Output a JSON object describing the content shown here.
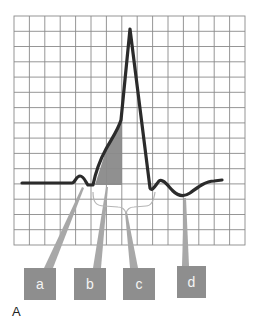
{
  "figure": {
    "panel_label": "A",
    "grid": {
      "x0": 14,
      "y0": 16,
      "x1": 245,
      "y1": 245,
      "cols": 15,
      "rows": 15,
      "color": "#8a8a8a"
    },
    "waveform": {
      "color": "#2b2b2b",
      "baseline_y": 183,
      "shaded_region_color": "#8a8a8a"
    },
    "labels": [
      {
        "id": "a",
        "text": "a",
        "box": {
          "x": 24,
          "y": 268,
          "w": 32,
          "h": 32
        }
      },
      {
        "id": "b",
        "text": "b",
        "box": {
          "x": 74,
          "y": 268,
          "w": 32,
          "h": 32
        }
      },
      {
        "id": "c",
        "text": "c",
        "box": {
          "x": 123,
          "y": 268,
          "w": 32,
          "h": 32
        }
      },
      {
        "id": "d",
        "text": "d",
        "box": {
          "x": 177,
          "y": 266,
          "w": 29,
          "h": 32
        }
      }
    ],
    "colors": {
      "label_box": "#8e8e8e",
      "label_text": "#f4f4f4",
      "pointer": "#a8a8a8"
    }
  }
}
